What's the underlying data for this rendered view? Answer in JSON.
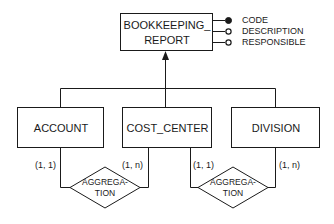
{
  "diagram": {
    "type": "entity-relationship generalization",
    "parent_entity": {
      "label_line1": "BOOKKEEPING_",
      "label_line2": "REPORT",
      "attributes": [
        {
          "name": "CODE",
          "identifier": true
        },
        {
          "name": "DESCRIPTION",
          "identifier": false
        },
        {
          "name": "RESPONSIBLE",
          "identifier": false
        }
      ]
    },
    "child_entities": [
      {
        "label": "ACCOUNT"
      },
      {
        "label": "COST_CENTER"
      },
      {
        "label": "DIVISION"
      }
    ],
    "relationships": [
      {
        "label_line1": "AGGREGA-",
        "label_line2": "TION",
        "left_cardinality": "(1, 1)",
        "right_cardinality": "(1, n)"
      },
      {
        "label_line1": "AGGREGA-",
        "label_line2": "TION",
        "left_cardinality": "(1, 1)",
        "right_cardinality": "(1, n)"
      }
    ]
  }
}
